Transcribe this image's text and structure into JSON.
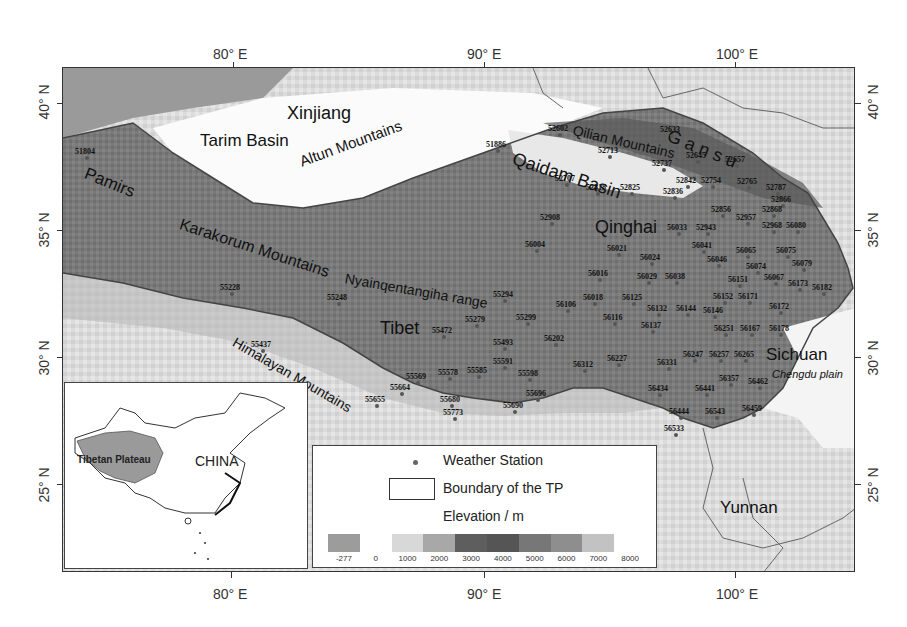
{
  "axes": {
    "top_lon": [
      {
        "label": "80° E",
        "x": 230
      },
      {
        "label": "90° E",
        "x": 484
      },
      {
        "label": "100° E",
        "x": 737
      }
    ],
    "bottom_lon": [
      {
        "label": "80° E",
        "x": 230
      },
      {
        "label": "90° E",
        "x": 484
      },
      {
        "label": "100° E",
        "x": 737
      }
    ],
    "left_lat": [
      {
        "label": "40° N",
        "y": 103
      },
      {
        "label": "35° N",
        "y": 230
      },
      {
        "label": "30° N",
        "y": 357
      },
      {
        "label": "25° N",
        "y": 484
      }
    ],
    "right_lat": [
      {
        "label": "40° N",
        "y": 103
      },
      {
        "label": "35° N",
        "y": 230
      },
      {
        "label": "30° N",
        "y": 357
      },
      {
        "label": "25° N",
        "y": 484
      }
    ]
  },
  "regions": [
    {
      "id": "xinjiang",
      "label": "Xinjiang",
      "x": 287,
      "y": 103,
      "size": 18,
      "rot": 0
    },
    {
      "id": "tarim-basin",
      "label": "Tarim Basin",
      "x": 200,
      "y": 131,
      "size": 17,
      "rot": 0
    },
    {
      "id": "pamirs",
      "label": "Pamirs",
      "x": 85,
      "y": 163,
      "size": 17,
      "rot": 22
    },
    {
      "id": "karakorum",
      "label": "Karakorum Mountains",
      "x": 180,
      "y": 215,
      "size": 16,
      "rot": 18
    },
    {
      "id": "altun",
      "label": "Altun Mountains",
      "x": 300,
      "y": 153,
      "size": 15,
      "rot": -20
    },
    {
      "id": "qaidam",
      "label": "Qaidam Basin",
      "x": 513,
      "y": 148,
      "size": 18,
      "rot": 18
    },
    {
      "id": "qilian",
      "label": "Qilian Mountains",
      "x": 573,
      "y": 122,
      "size": 14,
      "rot": 13
    },
    {
      "id": "gansu",
      "label": "G  a  n  s  u",
      "x": 668,
      "y": 125,
      "size": 18,
      "rot": 22
    },
    {
      "id": "qinghai",
      "label": "Qinghai",
      "x": 595,
      "y": 217,
      "size": 18,
      "rot": 0
    },
    {
      "id": "nyainqentanglha",
      "label": "Nyainqentangiha range",
      "x": 345,
      "y": 270,
      "size": 14,
      "rot": 10
    },
    {
      "id": "tibet",
      "label": "Tibet",
      "x": 380,
      "y": 318,
      "size": 18,
      "rot": 0
    },
    {
      "id": "himalayan",
      "label": "Himalayan Mountains",
      "x": 234,
      "y": 333,
      "size": 14,
      "rot": 30
    },
    {
      "id": "sichuan",
      "label": "Sichuan",
      "x": 766,
      "y": 345,
      "size": 17,
      "rot": 0
    },
    {
      "id": "yunnan",
      "label": "Yunnan",
      "x": 720,
      "y": 498,
      "size": 17,
      "rot": 0
    }
  ],
  "annotations": [
    {
      "id": "chengdu-plain",
      "label": "Chengdu plain",
      "x": 772,
      "y": 368,
      "size": 11,
      "italic": true
    }
  ],
  "stations": [
    {
      "id": "51804",
      "x": 75,
      "y": 147
    },
    {
      "id": "51886",
      "x": 486,
      "y": 140
    },
    {
      "id": "52602",
      "x": 548,
      "y": 124
    },
    {
      "id": "52633",
      "x": 660,
      "y": 125
    },
    {
      "id": "52713",
      "x": 598,
      "y": 146
    },
    {
      "id": "52645",
      "x": 686,
      "y": 151
    },
    {
      "id": "52737",
      "x": 652,
      "y": 159
    },
    {
      "id": "52657",
      "x": 725,
      "y": 155
    },
    {
      "id": "52707",
      "x": 555,
      "y": 174
    },
    {
      "id": "52842",
      "x": 676,
      "y": 176
    },
    {
      "id": "52754",
      "x": 701,
      "y": 176
    },
    {
      "id": "52765",
      "x": 737,
      "y": 177
    },
    {
      "id": "52787",
      "x": 766,
      "y": 183
    },
    {
      "id": "52818",
      "x": 586,
      "y": 183
    },
    {
      "id": "52825",
      "x": 620,
      "y": 183
    },
    {
      "id": "52836",
      "x": 663,
      "y": 187
    },
    {
      "id": "52866",
      "x": 771,
      "y": 195
    },
    {
      "id": "52868",
      "x": 762,
      "y": 205
    },
    {
      "id": "52856",
      "x": 711,
      "y": 205
    },
    {
      "id": "52957",
      "x": 736,
      "y": 213
    },
    {
      "id": "52908",
      "x": 540,
      "y": 213
    },
    {
      "id": "56033",
      "x": 667,
      "y": 223
    },
    {
      "id": "52943",
      "x": 696,
      "y": 223
    },
    {
      "id": "52968",
      "x": 762,
      "y": 221
    },
    {
      "id": "56080",
      "x": 786,
      "y": 221
    },
    {
      "id": "56004",
      "x": 525,
      "y": 240
    },
    {
      "id": "56021",
      "x": 607,
      "y": 244
    },
    {
      "id": "56041",
      "x": 692,
      "y": 241
    },
    {
      "id": "56024",
      "x": 640,
      "y": 253
    },
    {
      "id": "56046",
      "x": 707,
      "y": 255
    },
    {
      "id": "56065",
      "x": 736,
      "y": 246
    },
    {
      "id": "56075",
      "x": 776,
      "y": 246
    },
    {
      "id": "56079",
      "x": 792,
      "y": 259
    },
    {
      "id": "56074",
      "x": 746,
      "y": 262
    },
    {
      "id": "56016",
      "x": 588,
      "y": 269
    },
    {
      "id": "56029",
      "x": 637,
      "y": 272
    },
    {
      "id": "56038",
      "x": 665,
      "y": 272
    },
    {
      "id": "56151",
      "x": 728,
      "y": 275
    },
    {
      "id": "56067",
      "x": 764,
      "y": 273
    },
    {
      "id": "56173",
      "x": 788,
      "y": 279
    },
    {
      "id": "56182",
      "x": 812,
      "y": 283
    },
    {
      "id": "55228",
      "x": 220,
      "y": 283
    },
    {
      "id": "55248",
      "x": 327,
      "y": 293
    },
    {
      "id": "55294",
      "x": 493,
      "y": 290
    },
    {
      "id": "56018",
      "x": 583,
      "y": 293
    },
    {
      "id": "56125",
      "x": 622,
      "y": 293
    },
    {
      "id": "56152",
      "x": 713,
      "y": 292
    },
    {
      "id": "56171",
      "x": 738,
      "y": 292
    },
    {
      "id": "56106",
      "x": 556,
      "y": 300
    },
    {
      "id": "56132",
      "x": 647,
      "y": 304
    },
    {
      "id": "56144",
      "x": 676,
      "y": 304
    },
    {
      "id": "56146",
      "x": 703,
      "y": 306
    },
    {
      "id": "56172",
      "x": 769,
      "y": 302
    },
    {
      "id": "55279",
      "x": 465,
      "y": 315
    },
    {
      "id": "55299",
      "x": 516,
      "y": 313
    },
    {
      "id": "56116",
      "x": 603,
      "y": 313
    },
    {
      "id": "56137",
      "x": 641,
      "y": 321
    },
    {
      "id": "55472",
      "x": 432,
      "y": 326
    },
    {
      "id": "56251",
      "x": 714,
      "y": 324
    },
    {
      "id": "56167",
      "x": 740,
      "y": 324
    },
    {
      "id": "56178",
      "x": 769,
      "y": 324
    },
    {
      "id": "55493",
      "x": 493,
      "y": 338
    },
    {
      "id": "56202",
      "x": 544,
      "y": 334
    },
    {
      "id": "55437",
      "x": 251,
      "y": 340
    },
    {
      "id": "56247",
      "x": 683,
      "y": 350
    },
    {
      "id": "56257",
      "x": 709,
      "y": 350
    },
    {
      "id": "56265",
      "x": 734,
      "y": 350
    },
    {
      "id": "56227",
      "x": 607,
      "y": 354
    },
    {
      "id": "55591",
      "x": 493,
      "y": 357
    },
    {
      "id": "56331",
      "x": 657,
      "y": 358
    },
    {
      "id": "56312",
      "x": 573,
      "y": 360
    },
    {
      "id": "55578",
      "x": 438,
      "y": 368
    },
    {
      "id": "55585",
      "x": 467,
      "y": 366
    },
    {
      "id": "55598",
      "x": 518,
      "y": 369
    },
    {
      "id": "55569",
      "x": 406,
      "y": 372
    },
    {
      "id": "56357",
      "x": 719,
      "y": 374
    },
    {
      "id": "56462",
      "x": 748,
      "y": 377
    },
    {
      "id": "55664",
      "x": 390,
      "y": 383
    },
    {
      "id": "56434",
      "x": 648,
      "y": 384
    },
    {
      "id": "56441",
      "x": 695,
      "y": 384
    },
    {
      "id": "55696",
      "x": 526,
      "y": 389
    },
    {
      "id": "55655",
      "x": 365,
      "y": 395
    },
    {
      "id": "55680",
      "x": 440,
      "y": 395
    },
    {
      "id": "55690",
      "x": 503,
      "y": 401
    },
    {
      "id": "56459",
      "x": 742,
      "y": 404
    },
    {
      "id": "56444",
      "x": 669,
      "y": 407
    },
    {
      "id": "56543",
      "x": 705,
      "y": 407
    },
    {
      "id": "55773",
      "x": 443,
      "y": 408
    },
    {
      "id": "56533",
      "x": 664,
      "y": 424
    }
  ],
  "inset": {
    "plateau_label": "Tibetan Plateau",
    "country_label": "CHINA"
  },
  "legend": {
    "station_label": "Weather Station",
    "boundary_label": "Boundary of the TP",
    "elevation_title": "Elevation / m",
    "colorbar": [
      {
        "from": "-277",
        "color": "#9c9c9c"
      },
      {
        "from": "0",
        "color": "#ffffff"
      },
      {
        "from": "1000",
        "color": "#d8d8d8"
      },
      {
        "from": "2000",
        "color": "#a8a8a8"
      },
      {
        "from": "3000",
        "color": "#5e5e5e"
      },
      {
        "from": "4000",
        "color": "#555555"
      },
      {
        "from": "5000",
        "color": "#777777"
      },
      {
        "from": "6000",
        "color": "#8e8e8e"
      },
      {
        "from": "7000",
        "color": "#c2c2c2"
      },
      {
        "from": "8000",
        "color": "#ffffff"
      }
    ],
    "tick_labels": [
      "-277",
      "0",
      "1000",
      "2000",
      "3000",
      "4000",
      "5000",
      "6000",
      "7000",
      "8000"
    ]
  }
}
